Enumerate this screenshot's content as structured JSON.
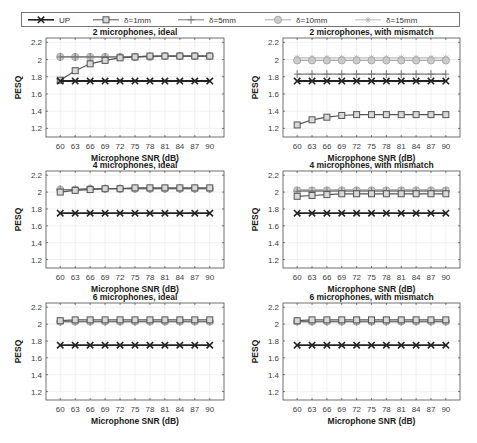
{
  "chart_data": {
    "type": "line",
    "legend": {
      "position": "top",
      "entries": [
        {
          "name": "UP",
          "marker": "x",
          "color": "#222222",
          "width": 1.6
        },
        {
          "name": "δ=1mm",
          "marker": "square",
          "color": "#555555",
          "width": 1.0
        },
        {
          "name": "δ=5mm",
          "marker": "plus",
          "color": "#777777",
          "width": 1.0
        },
        {
          "name": "δ=10mm",
          "marker": "circle",
          "color": "#aaaaaa",
          "width": 1.0
        },
        {
          "name": "δ=15mm",
          "marker": "asterisk",
          "color": "#bbbbbb",
          "width": 1.0
        }
      ]
    },
    "x": [
      60,
      63,
      66,
      69,
      72,
      75,
      78,
      81,
      84,
      87,
      90
    ],
    "xlabel": "Microphone SNR (dB)",
    "ylabel": "PESQ",
    "ylim": [
      1.1,
      2.25
    ],
    "yticks": [
      1.2,
      1.4,
      1.6,
      1.8,
      2,
      2.2
    ],
    "ytick_labels": [
      "1.2",
      "1.4",
      "1.6",
      "1.8",
      "2",
      "2.2"
    ],
    "grid": true,
    "panels": [
      {
        "title": "2 microphones, ideal",
        "series": [
          {
            "name": "UP",
            "values": [
              1.75,
              1.75,
              1.75,
              1.75,
              1.75,
              1.75,
              1.75,
              1.75,
              1.75,
              1.75,
              1.75
            ]
          },
          {
            "name": "δ=1mm",
            "values": [
              1.76,
              1.87,
              1.95,
              1.99,
              2.02,
              2.03,
              2.04,
              2.04,
              2.04,
              2.04,
              2.04
            ]
          },
          {
            "name": "δ=5mm",
            "values": [
              2.03,
              2.03,
              2.03,
              2.03,
              2.03,
              2.03,
              2.04,
              2.04,
              2.04,
              2.04,
              2.04
            ]
          },
          {
            "name": "δ=10mm",
            "values": [
              2.03,
              2.03,
              2.03,
              2.03,
              2.03,
              2.03,
              2.03,
              2.04,
              2.04,
              2.04,
              2.04
            ]
          },
          {
            "name": "δ=15mm",
            "values": [
              2.03,
              2.03,
              2.03,
              2.03,
              2.03,
              2.03,
              2.03,
              2.04,
              2.04,
              2.04,
              2.04
            ]
          }
        ]
      },
      {
        "title": "2 microphones, with mismatch",
        "series": [
          {
            "name": "UP",
            "values": [
              1.75,
              1.75,
              1.75,
              1.75,
              1.75,
              1.75,
              1.75,
              1.75,
              1.75,
              1.75,
              1.75
            ]
          },
          {
            "name": "δ=1mm",
            "values": [
              1.24,
              1.3,
              1.33,
              1.35,
              1.36,
              1.36,
              1.36,
              1.36,
              1.36,
              1.36,
              1.36
            ]
          },
          {
            "name": "δ=5mm",
            "values": [
              1.83,
              1.83,
              1.83,
              1.83,
              1.83,
              1.83,
              1.83,
              1.83,
              1.83,
              1.83,
              1.83
            ]
          },
          {
            "name": "δ=10mm",
            "values": [
              1.99,
              1.99,
              1.99,
              1.99,
              1.99,
              1.99,
              1.99,
              1.99,
              1.99,
              1.99,
              1.99
            ]
          },
          {
            "name": "δ=15mm",
            "values": [
              2.02,
              2.02,
              2.02,
              2.02,
              2.02,
              2.02,
              2.02,
              2.02,
              2.02,
              2.02,
              2.02
            ]
          }
        ]
      },
      {
        "title": "4 microphones, ideal",
        "series": [
          {
            "name": "UP",
            "values": [
              1.75,
              1.75,
              1.75,
              1.75,
              1.75,
              1.75,
              1.75,
              1.75,
              1.75,
              1.75,
              1.75
            ]
          },
          {
            "name": "δ=1mm",
            "values": [
              2.0,
              2.02,
              2.03,
              2.04,
              2.04,
              2.05,
              2.05,
              2.05,
              2.05,
              2.05,
              2.05
            ]
          },
          {
            "name": "δ=5mm",
            "values": [
              2.03,
              2.03,
              2.04,
              2.04,
              2.04,
              2.04,
              2.04,
              2.04,
              2.04,
              2.04,
              2.04
            ]
          },
          {
            "name": "δ=10mm",
            "values": [
              2.03,
              2.03,
              2.04,
              2.04,
              2.04,
              2.04,
              2.04,
              2.04,
              2.04,
              2.04,
              2.04
            ]
          },
          {
            "name": "δ=15mm",
            "values": [
              2.03,
              2.03,
              2.04,
              2.04,
              2.04,
              2.04,
              2.04,
              2.04,
              2.04,
              2.04,
              2.04
            ]
          }
        ]
      },
      {
        "title": "4 microphones, with mismatch",
        "series": [
          {
            "name": "UP",
            "values": [
              1.75,
              1.75,
              1.75,
              1.75,
              1.75,
              1.75,
              1.75,
              1.75,
              1.75,
              1.75,
              1.75
            ]
          },
          {
            "name": "δ=1mm",
            "values": [
              1.95,
              1.96,
              1.97,
              1.98,
              1.98,
              1.98,
              1.98,
              1.98,
              1.98,
              1.98,
              1.98
            ]
          },
          {
            "name": "δ=5mm",
            "values": [
              2.01,
              2.01,
              2.01,
              2.01,
              2.01,
              2.01,
              2.01,
              2.01,
              2.01,
              2.01,
              2.01
            ]
          },
          {
            "name": "δ=10mm",
            "values": [
              2.02,
              2.02,
              2.02,
              2.02,
              2.02,
              2.02,
              2.02,
              2.02,
              2.02,
              2.02,
              2.02
            ]
          },
          {
            "name": "δ=15mm",
            "values": [
              2.03,
              2.03,
              2.03,
              2.03,
              2.03,
              2.03,
              2.03,
              2.03,
              2.03,
              2.03,
              2.03
            ]
          }
        ]
      },
      {
        "title": "6 microphones, ideal",
        "series": [
          {
            "name": "UP",
            "values": [
              1.75,
              1.75,
              1.75,
              1.75,
              1.75,
              1.75,
              1.75,
              1.75,
              1.75,
              1.75,
              1.75
            ]
          },
          {
            "name": "δ=1mm",
            "values": [
              2.04,
              2.05,
              2.05,
              2.05,
              2.05,
              2.05,
              2.05,
              2.05,
              2.05,
              2.05,
              2.05
            ]
          },
          {
            "name": "δ=5mm",
            "values": [
              2.03,
              2.03,
              2.03,
              2.03,
              2.03,
              2.03,
              2.03,
              2.03,
              2.03,
              2.03,
              2.03
            ]
          },
          {
            "name": "δ=10mm",
            "values": [
              2.03,
              2.03,
              2.03,
              2.03,
              2.03,
              2.03,
              2.03,
              2.03,
              2.03,
              2.03,
              2.03
            ]
          },
          {
            "name": "δ=15mm",
            "values": [
              2.03,
              2.03,
              2.03,
              2.03,
              2.03,
              2.03,
              2.03,
              2.03,
              2.03,
              2.03,
              2.03
            ]
          }
        ]
      },
      {
        "title": "6 microphones, with mismatch",
        "series": [
          {
            "name": "UP",
            "values": [
              1.75,
              1.75,
              1.75,
              1.75,
              1.75,
              1.75,
              1.75,
              1.75,
              1.75,
              1.75,
              1.75
            ]
          },
          {
            "name": "δ=1mm",
            "values": [
              2.04,
              2.05,
              2.05,
              2.05,
              2.05,
              2.05,
              2.05,
              2.05,
              2.05,
              2.05,
              2.05
            ]
          },
          {
            "name": "δ=5mm",
            "values": [
              2.03,
              2.03,
              2.03,
              2.03,
              2.03,
              2.03,
              2.03,
              2.03,
              2.03,
              2.03,
              2.03
            ]
          },
          {
            "name": "δ=10mm",
            "values": [
              2.03,
              2.03,
              2.03,
              2.03,
              2.03,
              2.03,
              2.03,
              2.03,
              2.03,
              2.03,
              2.03
            ]
          },
          {
            "name": "δ=15mm",
            "values": [
              2.03,
              2.03,
              2.03,
              2.03,
              2.03,
              2.03,
              2.03,
              2.03,
              2.03,
              2.03,
              2.03
            ]
          }
        ]
      }
    ]
  }
}
